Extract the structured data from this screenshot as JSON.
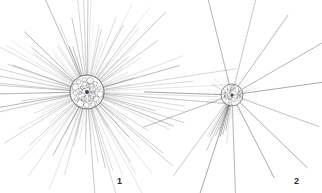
{
  "plate": {
    "width": 322,
    "height": 193,
    "background_color": "#ffffff",
    "ink_color": "#4a4a52",
    "label_color": "#2b2b2b",
    "kind": "scientific-illustration",
    "subject": "radiolarian-heliozoan-plate",
    "figure_count": 2
  },
  "figures": [
    {
      "id": "figure-1",
      "label": "1",
      "label_x": 117,
      "label_y": 177,
      "center_x": 87,
      "center_y": 92,
      "capsule_radius": 17,
      "halo_radius": 20,
      "spicule_count": 96,
      "spicule_min_length": 28,
      "spicule_max_length": 96,
      "vacuole_count": 26,
      "nucleus_radius": 2,
      "description": "Dense radiating heliozoan with vacuolated central capsule"
    },
    {
      "id": "figure-2",
      "label": "2",
      "label_x": 294,
      "label_y": 177,
      "center_x": 232,
      "center_y": 95,
      "capsule_radius": 11,
      "halo_radius": 24,
      "spicule_count": 13,
      "spicule_min_length": 60,
      "spicule_max_length": 115,
      "vacuole_count": 14,
      "nucleus_radius": 1.6,
      "description": "Sparse long-spiculed radiolarian with small dense central body"
    }
  ],
  "labels": {
    "figure_one": "1",
    "figure_two": "2"
  }
}
